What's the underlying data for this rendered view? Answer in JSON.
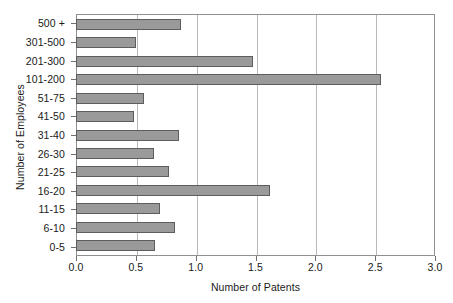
{
  "chart_data": {
    "type": "bar",
    "orientation": "horizontal",
    "title": "",
    "xlabel": "Number of Patents",
    "ylabel": "Number of Employees",
    "xlim": [
      0.0,
      3.0
    ],
    "xticks": [
      "0.0",
      "0.5",
      "1.0",
      "1.5",
      "2.0",
      "2.5",
      "3.0"
    ],
    "xtick_values": [
      0.0,
      0.5,
      1.0,
      1.5,
      2.0,
      2.5,
      3.0
    ],
    "grid": "vertical",
    "legend": "none",
    "bar_color": "#9a9a9a",
    "bar_edge_color": "#5d5d5d",
    "axis_color": "#8f8f8f",
    "gridline_color": "#b9b9b9",
    "categories": [
      "500 +",
      "301-500",
      "201-300",
      "101-200",
      "51-75",
      "41-50",
      "31-40",
      "26-30",
      "21-25",
      "16-20",
      "11-15",
      "6-10",
      "0-5"
    ],
    "values": [
      0.87,
      0.49,
      1.47,
      2.54,
      0.56,
      0.48,
      0.85,
      0.64,
      0.77,
      1.61,
      0.69,
      0.82,
      0.65
    ]
  }
}
